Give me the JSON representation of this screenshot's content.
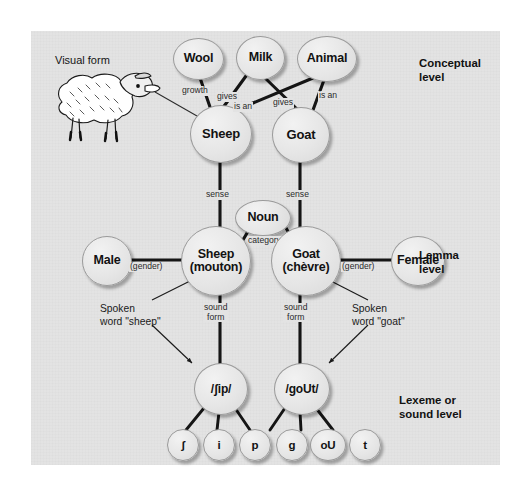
{
  "figure": {
    "panel_bg": "#e3e3e3",
    "node_fill": "#e6e6e6",
    "node_stroke": "#9a9a9a"
  },
  "levels": [
    {
      "id": "conceptual",
      "label": "Conceptual\nlevel",
      "line1": "Conceptual",
      "line2": "level"
    },
    {
      "id": "lemma",
      "label": "Lemma\nlevel",
      "line1": "Lemma",
      "line2": "level"
    },
    {
      "id": "lexeme",
      "label": "Lexeme or\nsound level",
      "line1": "Lexeme or",
      "line2": "sound level"
    }
  ],
  "visual_form": {
    "label": "Visual form",
    "icon": "sheep-drawing"
  },
  "nodes": {
    "conceptual": [
      {
        "id": "wool",
        "label": "Wool"
      },
      {
        "id": "milk",
        "label": "Milk"
      },
      {
        "id": "animal",
        "label": "Animal"
      },
      {
        "id": "sheep",
        "label": "Sheep"
      },
      {
        "id": "goat",
        "label": "Goat"
      }
    ],
    "lemma": [
      {
        "id": "male",
        "label": "Male"
      },
      {
        "id": "sheep_lemma",
        "label_line1": "Sheep",
        "label_line2": "(mouton)"
      },
      {
        "id": "noun",
        "label": "Noun"
      },
      {
        "id": "goat_lemma",
        "label_line1": "Goat",
        "label_line2": "(chèvre)"
      },
      {
        "id": "female",
        "label": "Female"
      }
    ],
    "lexeme": [
      {
        "id": "sheep_sound",
        "label": "/ʃip/"
      },
      {
        "id": "goat_sound",
        "label": "/goUt/"
      }
    ],
    "phonemes": [
      {
        "id": "ph_sh",
        "label": "ʃ"
      },
      {
        "id": "ph_i",
        "label": "i"
      },
      {
        "id": "ph_p",
        "label": "p"
      },
      {
        "id": "ph_g",
        "label": "g"
      },
      {
        "id": "ph_ou",
        "label": "oU"
      },
      {
        "id": "ph_t",
        "label": "t"
      }
    ]
  },
  "edge_labels": [
    {
      "id": "wool_sheep",
      "text": "growth"
    },
    {
      "id": "milk_sheep",
      "text": "gives"
    },
    {
      "id": "animal_sheep",
      "text": "is an"
    },
    {
      "id": "milk_goat",
      "text": "gives"
    },
    {
      "id": "animal_goat",
      "text": "is an"
    },
    {
      "id": "sheep_sense",
      "text": "sense"
    },
    {
      "id": "goat_sense",
      "text": "sense"
    },
    {
      "id": "noun_category",
      "text": "category"
    },
    {
      "id": "male_gender",
      "text": "(gender)"
    },
    {
      "id": "female_gender",
      "text": "(gender)"
    },
    {
      "id": "sheep_soundform",
      "line1": "sound",
      "line2": "form"
    },
    {
      "id": "goat_soundform",
      "line1": "sound",
      "line2": "form"
    }
  ],
  "annotations": [
    {
      "id": "spoken_sheep",
      "line1": "Spoken",
      "line2": "word \"sheep\""
    },
    {
      "id": "spoken_goat",
      "line1": "Spoken",
      "line2": "word \"goat\""
    }
  ]
}
